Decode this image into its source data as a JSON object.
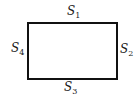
{
  "diagram": {
    "shape": "rectangle",
    "stroke_color": "#111111",
    "background": "#ffffff",
    "sides": [
      {
        "id": "s1",
        "position": "top",
        "base": "S",
        "subscript": "1"
      },
      {
        "id": "s2",
        "position": "right",
        "base": "S",
        "subscript": "2"
      },
      {
        "id": "s3",
        "position": "bottom",
        "base": "S",
        "subscript": "3"
      },
      {
        "id": "s4",
        "position": "left",
        "base": "S",
        "subscript": "4"
      }
    ]
  }
}
